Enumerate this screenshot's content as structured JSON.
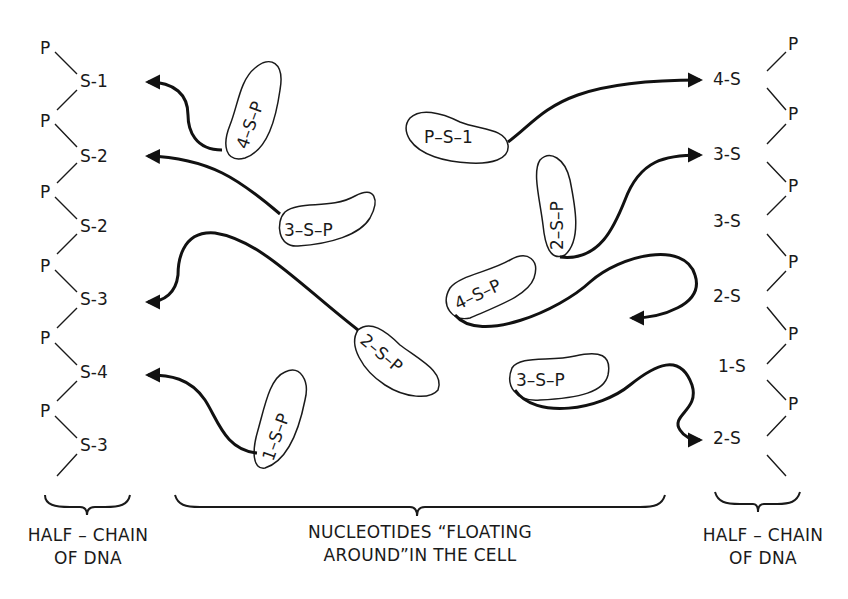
{
  "left_chain": {
    "backbone": [
      "P",
      "P",
      "P",
      "P",
      "P",
      "P"
    ],
    "bases": [
      "S-1",
      "S-2",
      "S-2",
      "S-3",
      "S-4",
      "S-3"
    ],
    "caption_line1": "HALF – CHAIN",
    "caption_line2": "OF DNA"
  },
  "right_chain": {
    "backbone": [
      "P",
      "P",
      "P",
      "P",
      "P",
      "P",
      "P"
    ],
    "bases": [
      "4-S",
      "3-S",
      "3-S",
      "2-S",
      "1-S",
      "2-S"
    ],
    "caption_line1": "HALF – CHAIN",
    "caption_line2": "OF DNA"
  },
  "nucleotides": [
    {
      "label": "4–S–P",
      "target": "left S-1"
    },
    {
      "label": "3–S–P",
      "target": "left S-2"
    },
    {
      "label": "2–S–P",
      "target": "left S-3"
    },
    {
      "label": "1–S–P",
      "target": "left S-4"
    },
    {
      "label": "P–S–1",
      "target": "right 4-S"
    },
    {
      "label": "2–S–P",
      "target": "right 3-S"
    },
    {
      "label": "4–S–P",
      "target": "free"
    },
    {
      "label": "3–S–P",
      "target": "right 2-S"
    }
  ],
  "middle_caption_line1": "NUCLEOTIDES “FLOATING",
  "middle_caption_line2": "AROUND”IN THE CELL",
  "arrow_color": "#111111"
}
